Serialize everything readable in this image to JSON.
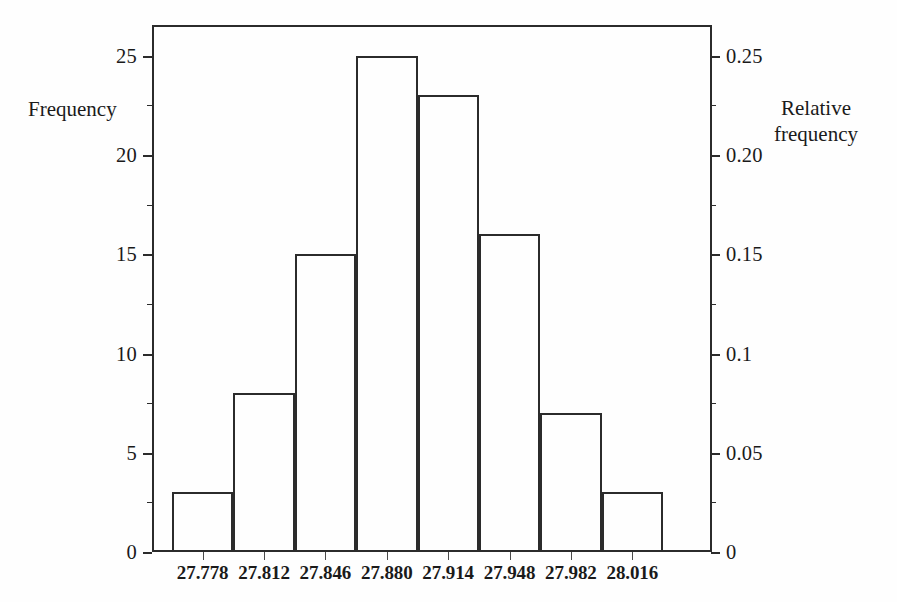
{
  "chart_data": {
    "type": "bar",
    "title": "",
    "xlabel": "",
    "ylabel": "Frequency",
    "y2label": "Relative frequency",
    "categories": [
      "27.778",
      "27.812",
      "27.846",
      "27.880",
      "27.914",
      "27.948",
      "27.982",
      "28.016"
    ],
    "values": [
      3,
      8,
      15,
      25,
      23,
      16,
      7,
      3
    ],
    "relative_values": [
      0.03,
      0.08,
      0.15,
      0.25,
      0.23,
      0.16,
      0.07,
      0.03
    ],
    "ylim": [
      0,
      26.55
    ],
    "y2lim": [
      0,
      0.2655
    ],
    "yticks": [
      0,
      5,
      10,
      15,
      20,
      25
    ],
    "yticklabels": [
      "0",
      "5",
      "10",
      "15",
      "20",
      "25"
    ],
    "y2ticks": [
      0,
      0.05,
      0.1,
      0.15,
      0.2,
      0.25
    ],
    "y2ticklabels": [
      "0",
      "0.05",
      "0.1",
      "0.15",
      "0.20",
      "0.25"
    ],
    "y_minor_ticks": [
      2.5,
      7.5,
      12.5,
      17.5,
      22.5
    ],
    "grid": false,
    "legend": null,
    "n_total": 100,
    "bar_fill": "none",
    "bar_edge_color": "#2b2b2b",
    "frame_color": "#2b2b2b",
    "background": "#ffffff"
  },
  "axes": {
    "left_title": "Frequency",
    "right_title_line1": "Relative",
    "right_title_line2": "frequency"
  }
}
